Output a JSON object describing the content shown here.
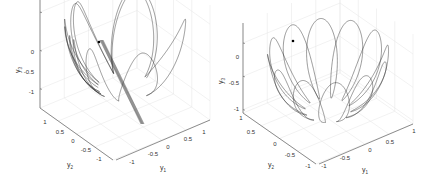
{
  "chart_data": [
    {
      "type": "line3d",
      "title": "",
      "xlabel": "y1",
      "ylabel": "y2",
      "zlabel": "y3",
      "xticks": [
        "-1",
        "-0.5",
        "0",
        "0.5",
        "1"
      ],
      "yticks": [
        "-1",
        "-0.5",
        "0",
        "0.5",
        "1"
      ],
      "zticks": [
        "0",
        "-0.5",
        "-1"
      ],
      "xlim": [
        -1,
        1
      ],
      "ylim": [
        -1,
        1
      ],
      "zlim": [
        -1.2,
        0.2
      ],
      "grid": true,
      "description": "Trajectory on the lower unit hemisphere forming petal-like loops with a dense band; start point marked with a dot",
      "marker": {
        "label": "start",
        "y1": -0.6,
        "y2": 0.3,
        "y3": 0.1
      }
    },
    {
      "type": "line3d",
      "title": "",
      "xlabel": "y1",
      "ylabel": "y2",
      "zlabel": "y3",
      "xticks": [
        "-1",
        "-0.5",
        "0",
        "0.5",
        "1"
      ],
      "yticks": [
        "-1",
        "-0.5",
        "0",
        "0.5",
        "1"
      ],
      "zticks": [
        "0",
        "-0.5",
        "-1"
      ],
      "xlim": [
        -1,
        1
      ],
      "ylim": [
        -1,
        1
      ],
      "zlim": [
        -1,
        0.1
      ],
      "grid": true,
      "description": "Regular rosette trajectory on the lower unit hemisphere with ~12 symmetric petals; start point marked with a dot",
      "marker": {
        "label": "start",
        "y1": -0.7,
        "y2": 0.6,
        "y3": 0.05
      }
    }
  ],
  "plots": {
    "left": {
      "zticks": [
        "0",
        "-0.5",
        "-1"
      ],
      "yticks": [
        "1",
        "0.5",
        "0",
        "-0.5",
        "-1"
      ],
      "xticks": [
        "-1",
        "-0.5",
        "0",
        "0.5",
        "1"
      ],
      "zlabel": "y",
      "zsub": "3",
      "ylabel": "y",
      "ysub": "2",
      "xlabel": "y",
      "xsub": "1"
    },
    "right": {
      "zticks": [
        "0",
        "-0.5",
        "-1"
      ],
      "yticks": [
        "1",
        "0.5",
        "0",
        "-0.5",
        "-1"
      ],
      "xticks": [
        "-1",
        "-0.5",
        "0",
        "0.5",
        "1"
      ],
      "zlabel": "y",
      "zsub": "3",
      "ylabel": "y",
      "ysub": "2",
      "xlabel": "y",
      "xsub": "1"
    }
  }
}
